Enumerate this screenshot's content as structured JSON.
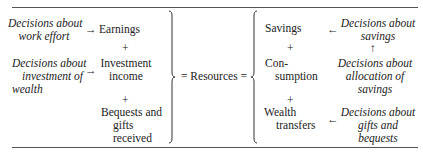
{
  "left": {
    "decisions": [
      {
        "lines": [
          "Decisions about",
          "work effort"
        ]
      },
      {
        "lines": [
          "Decisions about",
          "investment of",
          "wealth"
        ]
      }
    ],
    "arrows": [
      "→",
      "→"
    ],
    "sources": [
      {
        "lines": [
          "Earnings"
        ]
      },
      {
        "lines": [
          "Investment",
          "income"
        ]
      },
      {
        "lines": [
          "Bequests and",
          "gifts",
          "received"
        ]
      }
    ],
    "plus": "+"
  },
  "center": {
    "label": "= Resources ="
  },
  "right": {
    "uses": [
      {
        "lines": [
          "Savings"
        ]
      },
      {
        "lines": [
          "Con-",
          "sumption"
        ]
      },
      {
        "lines": [
          "Wealth",
          "transfers"
        ]
      }
    ],
    "plus": "+",
    "arrows": [
      "←",
      "↑",
      "←"
    ],
    "decisions": [
      {
        "lines": [
          "Decisions about",
          "savings"
        ]
      },
      {
        "lines": [
          "Decisions about",
          "allocation of",
          "savings"
        ]
      },
      {
        "lines": [
          "Decisions about",
          "gifts and",
          "bequests"
        ]
      }
    ]
  }
}
